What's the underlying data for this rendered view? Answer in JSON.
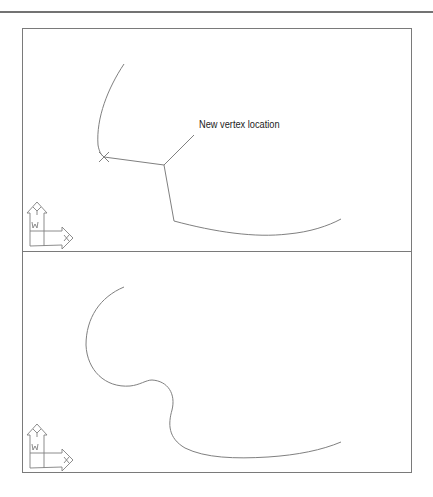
{
  "figure": {
    "top_rule_color": "#444444",
    "frame_color": "#7a7a7a",
    "stroke_color": "#808080",
    "panels": [
      {
        "id": "before",
        "annotation": "New vertex location",
        "ucs_icon": {
          "x_label": "X",
          "y_label": "Y",
          "w_label": "W"
        },
        "vertex_marker": "x-mark"
      },
      {
        "id": "after",
        "ucs_icon": {
          "x_label": "X",
          "y_label": "Y",
          "w_label": "W"
        }
      }
    ]
  }
}
